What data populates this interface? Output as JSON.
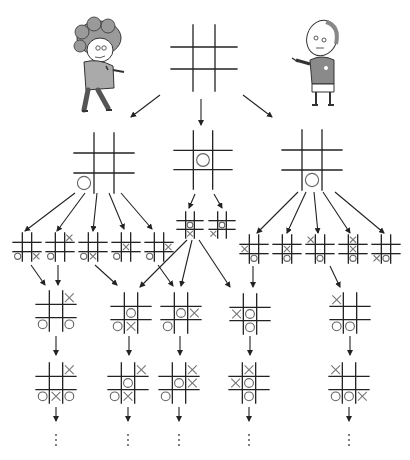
{
  "characters": [
    {
      "id": "player-o",
      "label": "Curly-haired kid",
      "x": 105,
      "y": 62
    },
    {
      "id": "player-x",
      "label": "Bald kid holding pen",
      "x": 320,
      "y": 62
    }
  ],
  "colors": {
    "line": "#222222",
    "mark": "#707070",
    "background": "#ffffff"
  },
  "boards": [
    {
      "id": "root",
      "level": 0,
      "cx": 204,
      "cy": 58,
      "size": 66,
      "cells": [
        "",
        "",
        "",
        "",
        "",
        "",
        "",
        "",
        ""
      ]
    },
    {
      "id": "l1-a",
      "level": 1,
      "cx": 104,
      "cy": 163,
      "size": 60,
      "cells": [
        "",
        "",
        "",
        "",
        "",
        "",
        "O",
        "",
        ""
      ]
    },
    {
      "id": "l1-b",
      "level": 1,
      "cx": 203,
      "cy": 160,
      "size": 58,
      "cells": [
        "",
        "",
        "",
        "",
        "O",
        "",
        "",
        "",
        ""
      ]
    },
    {
      "id": "l1-c",
      "level": 1,
      "cx": 312,
      "cy": 160,
      "size": 60,
      "cells": [
        "",
        "",
        "",
        "",
        "",
        "",
        "",
        "O",
        ""
      ]
    },
    {
      "id": "l2-a1",
      "level": 2,
      "cx": 27,
      "cy": 247,
      "size": 28,
      "cells": [
        "",
        "",
        "",
        "",
        "",
        "",
        "O",
        "",
        "X"
      ]
    },
    {
      "id": "l2-a2",
      "level": 2,
      "cx": 60,
      "cy": 247,
      "size": 28,
      "cells": [
        "",
        "",
        "X",
        "",
        "",
        "",
        "O",
        "",
        ""
      ]
    },
    {
      "id": "l2-a3",
      "level": 2,
      "cx": 93,
      "cy": 247,
      "size": 28,
      "cells": [
        "",
        "",
        "",
        "",
        "",
        "",
        "O",
        "X",
        ""
      ]
    },
    {
      "id": "l2-a4",
      "level": 2,
      "cx": 126,
      "cy": 247,
      "size": 28,
      "cells": [
        "",
        "",
        "",
        "",
        "X",
        "",
        "O",
        "",
        ""
      ]
    },
    {
      "id": "l2-a5",
      "level": 2,
      "cx": 159,
      "cy": 247,
      "size": 28,
      "cells": [
        "",
        "",
        "",
        "",
        "",
        "X",
        "O",
        "",
        ""
      ]
    },
    {
      "id": "l2-b1",
      "level": 2,
      "cx": 190,
      "cy": 225,
      "size": 26,
      "cells": [
        "",
        "",
        "",
        "",
        "O",
        "",
        "",
        "X",
        ""
      ]
    },
    {
      "id": "l2-b2",
      "level": 2,
      "cx": 222,
      "cy": 225,
      "size": 26,
      "cells": [
        "",
        "",
        "",
        "",
        "O",
        "",
        "X",
        "",
        ""
      ]
    },
    {
      "id": "l2-c1",
      "level": 2,
      "cx": 254,
      "cy": 249,
      "size": 28,
      "cells": [
        "",
        "",
        "",
        "X",
        "",
        "",
        "",
        "O",
        ""
      ]
    },
    {
      "id": "l2-c2",
      "level": 2,
      "cx": 287,
      "cy": 249,
      "size": 28,
      "cells": [
        "",
        "",
        "",
        "",
        "X",
        "",
        "",
        "O",
        ""
      ]
    },
    {
      "id": "l2-c3",
      "level": 2,
      "cx": 320,
      "cy": 249,
      "size": 28,
      "cells": [
        "X",
        "",
        "",
        "",
        "",
        "",
        "",
        "O",
        ""
      ]
    },
    {
      "id": "l2-c4",
      "level": 2,
      "cx": 353,
      "cy": 249,
      "size": 28,
      "cells": [
        "",
        "X",
        "",
        "",
        "X",
        "",
        "",
        "O",
        ""
      ]
    },
    {
      "id": "l2-c5",
      "level": 2,
      "cx": 386,
      "cy": 249,
      "size": 28,
      "cells": [
        "",
        "",
        "",
        "",
        "",
        "",
        "X",
        "O",
        ""
      ]
    },
    {
      "id": "l3-1",
      "level": 3,
      "cx": 56,
      "cy": 311,
      "size": 40,
      "cells": [
        "",
        "",
        "X",
        "",
        "",
        "",
        "O",
        "",
        "O"
      ]
    },
    {
      "id": "l3-2",
      "level": 3,
      "cx": 131,
      "cy": 313,
      "size": 40,
      "cells": [
        "",
        "",
        "",
        "",
        "O",
        "",
        "O",
        "X",
        ""
      ]
    },
    {
      "id": "l3-3",
      "level": 3,
      "cx": 181,
      "cy": 313,
      "size": 40,
      "cells": [
        "",
        "",
        "",
        "",
        "O",
        "X",
        "O",
        "",
        ""
      ]
    },
    {
      "id": "l3-4",
      "level": 3,
      "cx": 250,
      "cy": 314,
      "size": 40,
      "cells": [
        "",
        "",
        "",
        "X",
        "O",
        "",
        "",
        "O",
        ""
      ]
    },
    {
      "id": "l3-5",
      "level": 3,
      "cx": 350,
      "cy": 313,
      "size": 40,
      "cells": [
        "X",
        "",
        "",
        "",
        "",
        "",
        "O",
        "O",
        ""
      ]
    },
    {
      "id": "l4-1",
      "level": 4,
      "cx": 56,
      "cy": 383,
      "size": 40,
      "cells": [
        "",
        "",
        "X",
        "",
        "",
        "",
        "O",
        "X",
        "O"
      ]
    },
    {
      "id": "l4-2",
      "level": 4,
      "cx": 128,
      "cy": 383,
      "size": 40,
      "cells": [
        "",
        "",
        "X",
        "",
        "O",
        "",
        "O",
        "X",
        ""
      ]
    },
    {
      "id": "l4-3",
      "level": 4,
      "cx": 179,
      "cy": 383,
      "size": 40,
      "cells": [
        "",
        "",
        "X",
        "",
        "O",
        "X",
        "O",
        "",
        ""
      ]
    },
    {
      "id": "l4-4",
      "level": 4,
      "cx": 249,
      "cy": 383,
      "size": 40,
      "cells": [
        "",
        "X",
        "",
        "X",
        "O",
        "",
        "",
        "O",
        ""
      ]
    },
    {
      "id": "l4-5",
      "level": 4,
      "cx": 349,
      "cy": 383,
      "size": 40,
      "cells": [
        "X",
        "",
        "",
        "",
        "",
        "",
        "O",
        "O",
        "X"
      ]
    }
  ],
  "arrows": [
    {
      "from": [
        160,
        95
      ],
      "to": [
        131,
        117
      ]
    },
    {
      "from": [
        201,
        99
      ],
      "to": [
        201,
        125
      ]
    },
    {
      "from": [
        243,
        95
      ],
      "to": [
        272,
        117
      ]
    },
    {
      "from": [
        75,
        193
      ],
      "to": [
        25,
        231
      ]
    },
    {
      "from": [
        85,
        193
      ],
      "to": [
        57,
        231
      ]
    },
    {
      "from": [
        97,
        193
      ],
      "to": [
        93,
        231
      ]
    },
    {
      "from": [
        109,
        193
      ],
      "to": [
        124,
        229
      ]
    },
    {
      "from": [
        121,
        193
      ],
      "to": [
        152,
        229
      ]
    },
    {
      "from": [
        195,
        194
      ],
      "to": [
        189,
        208
      ]
    },
    {
      "from": [
        214,
        194
      ],
      "to": [
        222,
        208
      ]
    },
    {
      "from": [
        298,
        192
      ],
      "to": [
        257,
        233
      ]
    },
    {
      "from": [
        306,
        192
      ],
      "to": [
        287,
        233
      ]
    },
    {
      "from": [
        314,
        192
      ],
      "to": [
        318,
        233
      ]
    },
    {
      "from": [
        323,
        192
      ],
      "to": [
        350,
        233
      ]
    },
    {
      "from": [
        335,
        192
      ],
      "to": [
        384,
        233
      ]
    },
    {
      "from": [
        31,
        265
      ],
      "to": [
        45,
        285
      ]
    },
    {
      "from": [
        58,
        265
      ],
      "to": [
        58,
        285
      ]
    },
    {
      "from": [
        95,
        265
      ],
      "to": [
        117,
        285
      ]
    },
    {
      "from": [
        187,
        240
      ],
      "to": [
        140,
        287
      ]
    },
    {
      "from": [
        158,
        265
      ],
      "to": [
        173,
        286
      ]
    },
    {
      "from": [
        192,
        240
      ],
      "to": [
        181,
        286
      ]
    },
    {
      "from": [
        199,
        240
      ],
      "to": [
        230,
        287
      ]
    },
    {
      "from": [
        253,
        266
      ],
      "to": [
        253,
        287
      ]
    },
    {
      "from": [
        330,
        266
      ],
      "to": [
        340,
        287
      ]
    },
    {
      "from": [
        56,
        336
      ],
      "to": [
        56,
        355
      ]
    },
    {
      "from": [
        129,
        336
      ],
      "to": [
        129,
        355
      ]
    },
    {
      "from": [
        180,
        336
      ],
      "to": [
        180,
        355
      ]
    },
    {
      "from": [
        250,
        336
      ],
      "to": [
        250,
        355
      ]
    },
    {
      "from": [
        350,
        336
      ],
      "to": [
        350,
        355
      ]
    },
    {
      "from": [
        56,
        407
      ],
      "to": [
        56,
        421
      ]
    },
    {
      "from": [
        128,
        407
      ],
      "to": [
        128,
        421
      ]
    },
    {
      "from": [
        179,
        407
      ],
      "to": [
        179,
        421
      ]
    },
    {
      "from": [
        249,
        407
      ],
      "to": [
        249,
        421
      ]
    },
    {
      "from": [
        349,
        407
      ],
      "to": [
        349,
        421
      ]
    }
  ],
  "continuation": {
    "symbol": "⋮",
    "positions": [
      [
        56,
        440
      ],
      [
        128,
        440
      ],
      [
        179,
        440
      ],
      [
        249,
        440
      ],
      [
        349,
        440
      ]
    ]
  }
}
